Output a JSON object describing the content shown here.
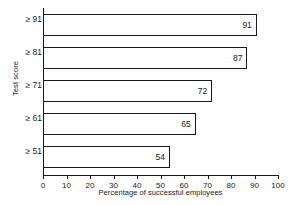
{
  "chart_data": {
    "type": "bar",
    "orientation": "horizontal",
    "title": "",
    "xlabel": "Percentage of successful employees",
    "ylabel": "Test score",
    "categories": [
      "≥ 91",
      "≥ 81",
      "≥ 71",
      "≥ 61",
      "≥ 51"
    ],
    "values": [
      91,
      87,
      72,
      65,
      54
    ],
    "value_labels": [
      "91",
      "87",
      "72",
      "65",
      "54"
    ],
    "xlim": [
      0,
      100
    ],
    "xticks": [
      0,
      10,
      20,
      30,
      40,
      50,
      60,
      70,
      80,
      90,
      100
    ],
    "xtick_labels": [
      "0",
      "10",
      "20",
      "30",
      "40",
      "50",
      "60",
      "70",
      "80",
      "90",
      "100"
    ],
    "grid": false,
    "legend": null,
    "colors": {
      "bar_fill": "#ffffff",
      "bar_edge": "#1a1a1a",
      "axis": "#1a1a1a",
      "text": "#1a1a1a",
      "background": "#ffffff"
    }
  }
}
